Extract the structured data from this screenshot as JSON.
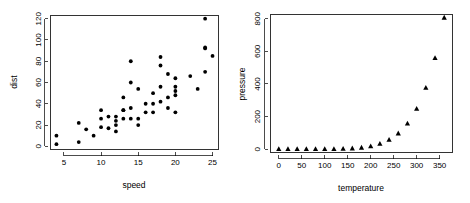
{
  "figure": {
    "background_color": "#ffffff",
    "foreground_color": "#000000",
    "panels": 2,
    "layout": "1 row x 2 columns"
  },
  "chart_data": [
    {
      "type": "scatter",
      "title": "",
      "xlabel": "speed",
      "ylabel": "dist",
      "xlim": [
        3.2,
        25.8
      ],
      "ylim": [
        -3,
        123
      ],
      "xticks": [
        5,
        10,
        15,
        20,
        25
      ],
      "yticks": [
        0,
        20,
        40,
        60,
        80,
        100,
        120
      ],
      "grid": false,
      "legend": null,
      "marker": "filled-circle",
      "marker_color": "#000000",
      "x": [
        4,
        4,
        7,
        7,
        8,
        9,
        10,
        10,
        10,
        11,
        11,
        12,
        12,
        12,
        12,
        13,
        13,
        13,
        13,
        14,
        14,
        14,
        14,
        15,
        15,
        15,
        16,
        16,
        17,
        17,
        17,
        18,
        18,
        18,
        18,
        19,
        19,
        19,
        20,
        20,
        20,
        20,
        20,
        22,
        23,
        24,
        24,
        24,
        24,
        25
      ],
      "y": [
        2,
        10,
        4,
        22,
        16,
        10,
        18,
        26,
        34,
        17,
        28,
        14,
        20,
        24,
        28,
        26,
        34,
        34,
        46,
        26,
        36,
        60,
        80,
        20,
        26,
        54,
        32,
        40,
        32,
        40,
        50,
        42,
        56,
        76,
        84,
        36,
        46,
        68,
        32,
        48,
        52,
        56,
        64,
        66,
        54,
        70,
        92,
        93,
        120,
        85
      ]
    },
    {
      "type": "scatter",
      "title": "",
      "xlabel": "temperature",
      "ylabel": "pressure",
      "xlim": [
        -18,
        378
      ],
      "ylim": [
        -20,
        826
      ],
      "xticks": [
        0,
        50,
        100,
        150,
        200,
        250,
        300,
        350
      ],
      "yticks": [
        0,
        200,
        400,
        600,
        800
      ],
      "grid": false,
      "legend": null,
      "marker": "filled-triangle",
      "marker_color": "#000000",
      "x": [
        0,
        20,
        40,
        60,
        80,
        100,
        120,
        140,
        160,
        180,
        200,
        220,
        240,
        260,
        280,
        300,
        320,
        340,
        360
      ],
      "y": [
        0.0002,
        0.0012,
        0.006,
        0.03,
        0.09,
        0.27,
        0.75,
        1.85,
        4.2,
        8.8,
        17.3,
        32.1,
        57.0,
        96.0,
        157.0,
        247.0,
        376.0,
        558.0,
        806.0
      ]
    }
  ]
}
